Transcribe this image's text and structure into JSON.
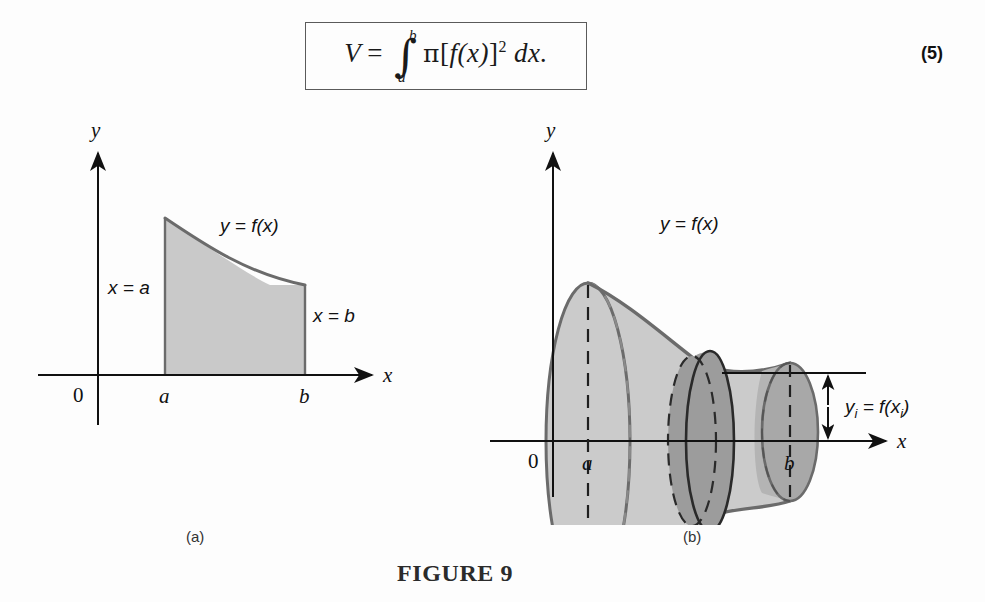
{
  "equation": {
    "number": "(5)",
    "lhs": "V",
    "equals": "=",
    "integral_symbol": "∫",
    "lower_limit": "a",
    "upper_limit": "b",
    "pi": "π",
    "bracket_open": "[",
    "function": "f(x)",
    "bracket_close": "]",
    "exponent": "2",
    "differential": "dx.",
    "full_text": "V = ∫ₐᵇ π[f(x)]² dx."
  },
  "figure": {
    "title": "FIGURE 9",
    "panel_a": {
      "caption": "(a)",
      "y_axis_label": "y",
      "x_axis_label": "x",
      "origin_label": "0",
      "tick_a": "a",
      "tick_b": "b",
      "curve_label": "y = f(x)",
      "left_boundary_label": "x = a",
      "right_boundary_label": "x = b"
    },
    "panel_b": {
      "caption": "(b)",
      "y_axis_label": "y",
      "x_axis_label": "x",
      "origin_label": "0",
      "tick_a": "a",
      "tick_b": "b",
      "curve_label": "y = f(x)",
      "radius_label_main": "y",
      "radius_label_sub": "i",
      "radius_label_eq": " = f(x",
      "radius_label_sub2": "i",
      "radius_label_close": ")",
      "radius_label_full": "yᵢ = f(xᵢ)",
      "thickness_label_delta": "Δx",
      "thickness_label_sub": "i",
      "thickness_label_full": "Δxᵢ"
    }
  },
  "colors": {
    "page_background": "#fdfdfd",
    "ink": "#111111",
    "region_fill": "#c9c9c9",
    "solid_fill_light": "#cccccc",
    "solid_fill_mid": "#c0c0c0",
    "disk_fill_dark": "#a2a2a2",
    "endcap_fill": "#aaaaaa",
    "curve_stroke": "#6b6b6b",
    "axis_stroke": "#1a1a1a",
    "box_border": "#5a5a5a"
  }
}
